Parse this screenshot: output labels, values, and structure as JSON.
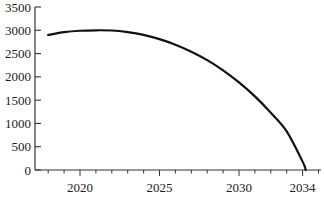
{
  "chart_data": {
    "type": "line",
    "title": "",
    "xlabel": "",
    "ylabel": "",
    "xlim": [
      2017.6,
      2034.6
    ],
    "ylim": [
      0,
      3500
    ],
    "grid": false,
    "legend": null,
    "x_ticks": [
      2020,
      2025,
      2030,
      2034
    ],
    "x_minor_tick_step": 1,
    "y_ticks": [
      0,
      500,
      1000,
      1500,
      2000,
      2500,
      3000,
      3500
    ],
    "series": [
      {
        "name": "curve",
        "color": "#111111",
        "x": [
          2018,
          2019,
          2020,
          2021,
          2022,
          2023,
          2024,
          2025,
          2026,
          2027,
          2028,
          2029,
          2030,
          2031,
          2032,
          2033,
          2034,
          2034.2
        ],
        "y": [
          2900,
          2960,
          2990,
          3000,
          2995,
          2960,
          2900,
          2810,
          2690,
          2540,
          2360,
          2140,
          1880,
          1580,
          1230,
          830,
          180,
          0
        ]
      }
    ]
  }
}
